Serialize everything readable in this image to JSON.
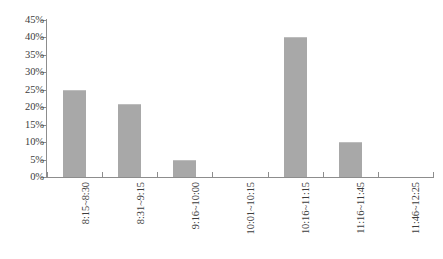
{
  "chart_data": {
    "type": "bar",
    "title": "",
    "subtitle": "",
    "xlabel": "",
    "ylabel": "",
    "categories": [
      "8:15~8:30",
      "8:31~9:15",
      "9:16~10:00",
      "10:01~10:15",
      "10:16~11:15",
      "11:16~11:45",
      "11:46~12:25"
    ],
    "values": [
      25,
      21,
      5,
      0,
      40,
      10,
      0
    ],
    "value_labels": [
      "25%",
      "21%",
      "5%",
      "0%",
      "40%",
      "10%",
      "0%"
    ],
    "ylim": [
      0,
      45
    ],
    "ytick_values": [
      0,
      5,
      10,
      15,
      20,
      25,
      30,
      35,
      40,
      45
    ],
    "ytick_labels": [
      "0%",
      "5%",
      "10%",
      "15%",
      "20%",
      "25%",
      "30%",
      "35%",
      "40%",
      "45%"
    ],
    "grid": false,
    "legend": null,
    "legend_position": "none",
    "bar_color": "#a8a8a8",
    "bar_edge_color": "#bdbdbd",
    "axis_color": "#8d8d8d",
    "text_color": "#3c3c3c",
    "background_color": "#ffffff",
    "xtick_label_rotation": 90
  },
  "caption": {
    "text": ""
  }
}
